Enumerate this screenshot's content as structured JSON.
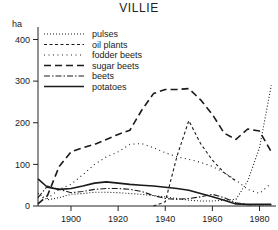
{
  "chart_data": {
    "type": "line",
    "title": "VILLIE",
    "xlabel": "",
    "ylabel": "ha",
    "ylim": [
      0,
      430
    ],
    "xlim": [
      1886,
      1987
    ],
    "grid": false,
    "legend_position": "top-left",
    "y_ticks": [
      0,
      100,
      200,
      300,
      400
    ],
    "y_tick_labels": [
      "0",
      "100",
      "200",
      "300",
      "400"
    ],
    "x_ticks": [
      1900,
      1920,
      1940,
      1960,
      1980
    ],
    "x_tick_labels": [
      "1900",
      "1920",
      "1940",
      "1960",
      "1980"
    ],
    "series": [
      {
        "name": "pulses",
        "style": "dotted-fine",
        "x": [
          1886,
          1890,
          1895,
          1900,
          1905,
          1910,
          1915,
          1920,
          1925,
          1930,
          1935,
          1940,
          1945,
          1950,
          1955,
          1960,
          1965,
          1970,
          1975,
          1980,
          1985
        ],
        "values": [
          30,
          15,
          20,
          28,
          30,
          33,
          33,
          32,
          30,
          28,
          25,
          22,
          18,
          14,
          12,
          12,
          14,
          16,
          60,
          140,
          290
        ]
      },
      {
        "name": "oil plants",
        "style": "dashed-small",
        "x": [
          1935,
          1940,
          1945,
          1950,
          1955,
          1960,
          1965,
          1970
        ],
        "values": [
          0,
          10,
          120,
          205,
          150,
          110,
          80,
          60
        ]
      },
      {
        "name": "fodder beets",
        "style": "dotted-sparse",
        "x": [
          1886,
          1890,
          1895,
          1900,
          1905,
          1910,
          1915,
          1920,
          1925,
          1930,
          1935,
          1940,
          1945,
          1950,
          1955,
          1960,
          1965,
          1970,
          1975,
          1980,
          1985
        ],
        "values": [
          22,
          18,
          40,
          52,
          75,
          100,
          118,
          130,
          148,
          150,
          140,
          128,
          118,
          112,
          105,
          95,
          80,
          62,
          40,
          30,
          55
        ]
      },
      {
        "name": "sugar beets",
        "style": "dashed-long",
        "x": [
          1886,
          1890,
          1895,
          1900,
          1905,
          1910,
          1915,
          1920,
          1925,
          1930,
          1935,
          1940,
          1945,
          1950,
          1955,
          1960,
          1965,
          1970,
          1975,
          1980,
          1985
        ],
        "values": [
          5,
          25,
          95,
          130,
          140,
          148,
          160,
          172,
          182,
          230,
          270,
          280,
          280,
          282,
          255,
          220,
          175,
          160,
          185,
          180,
          130
        ]
      },
      {
        "name": "beets",
        "style": "dash-dot",
        "x": [
          1886,
          1890,
          1895,
          1900,
          1905,
          1910,
          1915,
          1920,
          1925,
          1930,
          1935,
          1940,
          1945,
          1950,
          1955,
          1960,
          1965,
          1970,
          1975,
          1980,
          1985
        ],
        "values": [
          20,
          48,
          40,
          32,
          35,
          40,
          42,
          42,
          40,
          35,
          25,
          18,
          16,
          18,
          22,
          28,
          20,
          8,
          3,
          3,
          3
        ]
      },
      {
        "name": "potatoes",
        "style": "solid",
        "x": [
          1886,
          1890,
          1895,
          1900,
          1905,
          1910,
          1915,
          1920,
          1925,
          1930,
          1935,
          1940,
          1945,
          1950,
          1955,
          1960,
          1965,
          1970,
          1975,
          1980,
          1985
        ],
        "values": [
          65,
          45,
          40,
          42,
          48,
          55,
          58,
          55,
          52,
          50,
          48,
          45,
          42,
          38,
          30,
          22,
          14,
          5,
          4,
          4,
          4
        ]
      }
    ],
    "legend": [
      {
        "label": "pulses",
        "style": "dotted-fine"
      },
      {
        "label": "oil plants",
        "style": "dashed-small"
      },
      {
        "label": "fodder beets",
        "style": "dotted-sparse"
      },
      {
        "label": "sugar beets",
        "style": "dashed-long"
      },
      {
        "label": "beets",
        "style": "dash-dot"
      },
      {
        "label": "potatoes",
        "style": "solid"
      }
    ],
    "colors": {
      "axis": "#222222",
      "line": "#1a1a1a",
      "background": "#ffffff"
    }
  }
}
